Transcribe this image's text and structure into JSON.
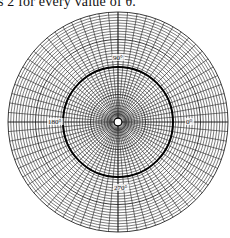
{
  "caption": {
    "text": "s 2 for every value of θ."
  },
  "diagram": {
    "type": "polar-graph",
    "center": [
      118,
      122
    ],
    "outer_radius": 110,
    "ring_count": 40,
    "spoke_count": 72,
    "highlight_circle": {
      "r_value": 2,
      "pixel_radius": 55
    },
    "angle_labels": [
      {
        "text": "90°",
        "angle": 90
      },
      {
        "text": "180°",
        "angle": 180
      },
      {
        "text": "0°",
        "angle": 0
      },
      {
        "text": "270°",
        "angle": 270
      }
    ],
    "colors": {
      "grid": "#222222",
      "curve": "#000000",
      "background": "#ffffff"
    }
  }
}
